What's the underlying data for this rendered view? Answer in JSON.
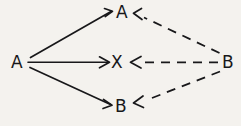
{
  "canvas": {
    "width": 241,
    "height": 126,
    "background_color": "#f4f2ee",
    "stroke_color": "#18181a"
  },
  "diagram": {
    "type": "directed-graph",
    "style": "hand-drawn",
    "title": "",
    "nodes": [
      {
        "id": "a-left",
        "label": "A",
        "x": 17,
        "y": 62,
        "role": "source-left"
      },
      {
        "id": "a-top",
        "label": "A",
        "x": 122,
        "y": 12,
        "role": "target-top"
      },
      {
        "id": "x-middle",
        "label": "X",
        "x": 117,
        "y": 62,
        "role": "target-middle"
      },
      {
        "id": "b-bottom",
        "label": "B",
        "x": 121,
        "y": 106,
        "role": "target-bottom"
      },
      {
        "id": "b-right",
        "label": "B",
        "x": 228,
        "y": 62,
        "role": "source-right"
      }
    ],
    "edges": [
      {
        "id": "edge-a-left-to-a-top",
        "from": "a-left",
        "to": "a-top",
        "line_style": "solid",
        "arrow": "end",
        "x1": 30,
        "y1": 57,
        "x2": 110,
        "y2": 11
      },
      {
        "id": "edge-a-left-to-x",
        "from": "a-left",
        "to": "x-middle",
        "line_style": "solid",
        "arrow": "end",
        "x1": 28,
        "y1": 62,
        "x2": 107,
        "y2": 62
      },
      {
        "id": "edge-a-left-to-b-bottom",
        "from": "a-left",
        "to": "b-bottom",
        "line_style": "solid",
        "arrow": "end",
        "x1": 30,
        "y1": 68,
        "x2": 110,
        "y2": 105
      },
      {
        "id": "edge-b-right-to-a-top",
        "from": "b-right",
        "to": "a-top",
        "line_style": "dashed",
        "arrow": "end",
        "x1": 220,
        "y1": 53,
        "x2": 135,
        "y2": 13
      },
      {
        "id": "edge-b-right-to-x",
        "from": "b-right",
        "to": "x-middle",
        "line_style": "dashed",
        "arrow": "end",
        "x1": 218,
        "y1": 62,
        "x2": 132,
        "y2": 62
      },
      {
        "id": "edge-b-right-to-b-bottom",
        "from": "b-right",
        "to": "b-bottom",
        "line_style": "dashed",
        "arrow": "end",
        "x1": 220,
        "y1": 72,
        "x2": 136,
        "y2": 104
      }
    ]
  }
}
